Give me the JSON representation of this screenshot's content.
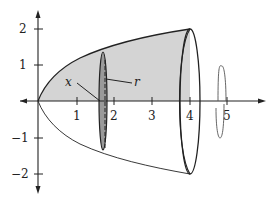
{
  "figure": {
    "function": "y = sqrt(x)",
    "x_range": [
      0,
      4
    ],
    "axis_of_rotation": "x-axis",
    "x_ticks": [
      "1",
      "2",
      "3",
      "4",
      "5"
    ],
    "y_ticks": [
      "2",
      "1",
      "-1",
      "-2"
    ],
    "y_tick_labels_display": [
      "2",
      "1",
      "−1",
      "−2"
    ],
    "labels": {
      "x_label": "x",
      "r_label": "r"
    },
    "disk_position_x": 1.8,
    "colors": {
      "region_fill": "#d4d4d4",
      "disk_fill": "#9a9a9a",
      "stroke": "#222222",
      "rotation_arrow": "#555555"
    }
  }
}
